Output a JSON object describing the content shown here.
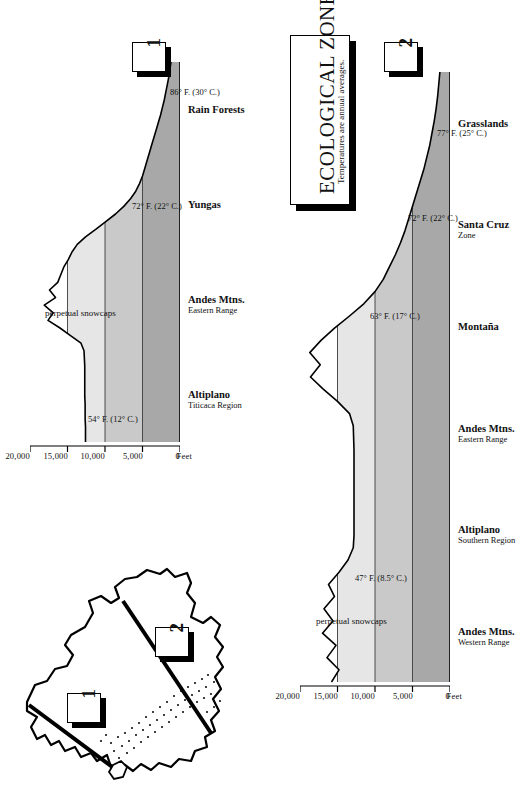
{
  "document": {
    "title_main": "ECOLOGICAL ZONES",
    "title_sub": "Temperatures are annual averages."
  },
  "colors": {
    "ink": "#000000",
    "band_low": "#a8a8a8",
    "band_mid": "#c9c9c9",
    "band_high": "#e6e6e6",
    "paper": "#ffffff"
  },
  "inset_map": {
    "name": "bolivia-outline-map",
    "transect_markers": [
      {
        "label": "1",
        "name": "transect-marker-1"
      },
      {
        "label": "2",
        "name": "transect-marker-2"
      }
    ]
  },
  "panels": [
    {
      "key": "1",
      "name": "cross-section-panel-1",
      "axis": {
        "caption": "Feet",
        "ticks": [
          "20,000",
          "15,000",
          "10,000",
          "5,000",
          "0"
        ],
        "tick_values": [
          20000,
          15000,
          10000,
          5000,
          0
        ],
        "max": 20000
      },
      "snowcap_label": "perpetual snowcaps",
      "temperature_labels": [
        "54° F. (12° C.)",
        "72° F. (22° C.)",
        "86° F. (30° C.)"
      ],
      "zones": [
        {
          "name": "Altiplano",
          "sub": "Titicaca Region"
        },
        {
          "name": "Andes Mtns.",
          "sub": "Eastern Range"
        },
        {
          "name": "Yungas",
          "sub": ""
        },
        {
          "name": "Rain Forests",
          "sub": ""
        }
      ]
    },
    {
      "key": "2",
      "name": "cross-section-panel-2",
      "axis": {
        "caption": "Feet",
        "ticks": [
          "20,000",
          "15,000",
          "10,000",
          "5,000",
          "0"
        ],
        "tick_values": [
          20000,
          15000,
          10000,
          5000,
          0
        ],
        "max": 20000
      },
      "snowcap_label": "perpetual snowcaps",
      "temperature_labels": [
        "47° F. (8.5° C.)",
        "63° F. (17° C.)",
        "72° F. (22° C.)",
        "77° F. (25° C.)"
      ],
      "zones": [
        {
          "name": "Andes Mtns.",
          "sub": "Western Range"
        },
        {
          "name": "Altiplano",
          "sub": "Southern Region"
        },
        {
          "name": "Andes Mtns.",
          "sub": "Eastern Range"
        },
        {
          "name": "Montaña",
          "sub": ""
        },
        {
          "name": "Santa Cruz",
          "sub": "Zone"
        },
        {
          "name": "Grasslands",
          "sub": ""
        }
      ]
    }
  ],
  "chart_data": [
    {
      "type": "area",
      "title": "Cross-Section 1 — Altiplano (Titicaca Region) to Rain Forests",
      "xlabel": "",
      "ylabel": "Feet",
      "ylim": [
        0,
        20000
      ],
      "grid": false,
      "legend": "none",
      "x": [
        0,
        2,
        4,
        6,
        8,
        10,
        12,
        14,
        16,
        18,
        20,
        22,
        24,
        26,
        28,
        30,
        32,
        34,
        36,
        38,
        40,
        42,
        44,
        46,
        48,
        50,
        52,
        54,
        56,
        58,
        60,
        62,
        64,
        66,
        68,
        70,
        72,
        74,
        76,
        78,
        80,
        82,
        84,
        86,
        88,
        90,
        92,
        94,
        96,
        98,
        100
      ],
      "series": [
        {
          "name": "Surface elevation (ft)",
          "values": [
            12600,
            12600,
            12600,
            12650,
            12650,
            12650,
            12700,
            12700,
            12700,
            12700,
            12700,
            12750,
            12800,
            13200,
            14600,
            16000,
            17600,
            16900,
            18100,
            16600,
            17400,
            16300,
            15900,
            15500,
            14900,
            14400,
            13700,
            12600,
            11200,
            9900,
            8600,
            7500,
            6600,
            5900,
            5400,
            5000,
            4700,
            4400,
            4100,
            3800,
            3500,
            3200,
            2900,
            2600,
            2350,
            2100,
            1900,
            1700,
            1500,
            1350,
            1200
          ]
        }
      ],
      "bands": [
        {
          "name": "0 – 5,000 ft",
          "from": 0,
          "to": 5000,
          "shade": "#a8a8a8"
        },
        {
          "name": "5,000 – 10,000 ft",
          "from": 5000,
          "to": 10000,
          "shade": "#c9c9c9"
        },
        {
          "name": "10,000 – 15,000 ft",
          "from": 10000,
          "to": 15000,
          "shade": "#e6e6e6"
        }
      ],
      "annotations": [
        {
          "text": "perpetual snowcaps",
          "near_x": 34,
          "near_y": 18600
        },
        {
          "text": "54° F. (12° C.)",
          "near_x": 6,
          "near_y": 12800
        },
        {
          "text": "72° F. (22° C.)",
          "near_x": 62,
          "near_y": 7000
        },
        {
          "text": "86° F. (30° C.)",
          "near_x": 92,
          "near_y": 1900
        }
      ],
      "tick_labels": [
        "20,000",
        "15,000",
        "10,000",
        "5,000",
        "0"
      ]
    },
    {
      "type": "area",
      "title": "Cross-Section 2 — Andes Western Range to Grasslands",
      "xlabel": "",
      "ylabel": "Feet",
      "ylim": [
        0,
        20000
      ],
      "grid": false,
      "legend": "none",
      "x": [
        0,
        2,
        4,
        6,
        8,
        10,
        12,
        14,
        16,
        18,
        20,
        22,
        24,
        26,
        28,
        30,
        32,
        34,
        36,
        38,
        40,
        42,
        44,
        46,
        48,
        50,
        52,
        54,
        56,
        58,
        60,
        62,
        64,
        66,
        68,
        70,
        72,
        74,
        76,
        78,
        80,
        82,
        84,
        86,
        88,
        90,
        92,
        94,
        96,
        98,
        100
      ],
      "series": [
        {
          "name": "Surface elevation (ft)",
          "values": [
            15800,
            14800,
            16400,
            15200,
            17000,
            15600,
            16800,
            15400,
            16200,
            14800,
            13600,
            12900,
            12800,
            12800,
            12800,
            12800,
            12800,
            12800,
            12800,
            12800,
            12850,
            12900,
            13400,
            15000,
            16900,
            18600,
            17300,
            18700,
            17200,
            15400,
            13400,
            11500,
            10000,
            8900,
            8100,
            7300,
            6600,
            6000,
            5500,
            5000,
            4500,
            4000,
            3500,
            3100,
            2700,
            2400,
            2100,
            1850,
            1650,
            1500,
            1350
          ]
        }
      ],
      "bands": [
        {
          "name": "0 – 5,000 ft",
          "from": 0,
          "to": 5000,
          "shade": "#a8a8a8"
        },
        {
          "name": "5,000 – 10,000 ft",
          "from": 5000,
          "to": 10000,
          "shade": "#c9c9c9"
        },
        {
          "name": "10,000 – 15,000 ft",
          "from": 10000,
          "to": 15000,
          "shade": "#e6e6e6"
        }
      ],
      "annotations": [
        {
          "text": "perpetual snowcaps",
          "near_x": 10,
          "near_y": 18400
        },
        {
          "text": "47° F. (8.5° C.)",
          "near_x": 17,
          "near_y": 13200
        },
        {
          "text": "63° F. (17° C.)",
          "near_x": 60,
          "near_y": 11200
        },
        {
          "text": "72° F. (22° C.)",
          "near_x": 76,
          "near_y": 6200
        },
        {
          "text": "77° F. (25° C.)",
          "near_x": 90,
          "near_y": 2300
        }
      ],
      "tick_labels": [
        "20,000",
        "15,000",
        "10,000",
        "5,000",
        "0"
      ]
    }
  ]
}
